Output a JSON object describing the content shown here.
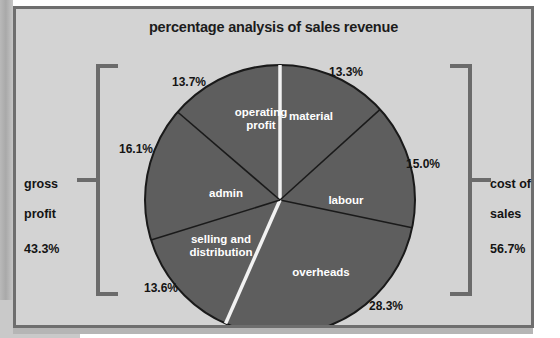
{
  "frame": {
    "background_color": "#d3d3d3",
    "border_color": "#6e6e6e"
  },
  "title": "percentage analysis of sales revenue",
  "left_bracket": {
    "name": "gross profit",
    "label_line1": "gross",
    "label_line2": "profit",
    "value": "43.3%"
  },
  "right_bracket": {
    "name": "cost of sales",
    "label_line1": "cost of",
    "label_line2": "sales",
    "value": "56.7%"
  },
  "chart_data": {
    "type": "pie",
    "title": "percentage analysis of sales revenue",
    "unit": "percent",
    "slice_color": "#5e5e5e",
    "separator_color": "#1a1a1a",
    "group_separator_color": "#f2f2f2",
    "label_color": "#ffffff",
    "categories": [
      "material",
      "labour",
      "overheads",
      "selling and distribution",
      "admin",
      "operating profit"
    ],
    "values": [
      13.3,
      15.0,
      28.3,
      13.6,
      16.1,
      13.7
    ],
    "value_labels": [
      "13.3%",
      "15.0%",
      "28.3%",
      "13.6%",
      "16.1%",
      "13.7%"
    ],
    "groups": [
      {
        "name": "cost of sales",
        "value": 56.7,
        "value_label": "56.7%",
        "members": [
          "material",
          "labour",
          "overheads"
        ]
      },
      {
        "name": "gross profit",
        "value": 43.3,
        "value_label": "43.3%",
        "members": [
          "selling and distribution",
          "admin",
          "operating profit"
        ]
      }
    ],
    "legend": "none",
    "grid": false,
    "start_angle_deg": 0,
    "direction": "clockwise"
  },
  "slices": [
    {
      "id": "material",
      "label": "material",
      "pct": "13.3%",
      "label_x": 295,
      "label_y": 108,
      "pct_x": 335,
      "pct_y": 63
    },
    {
      "id": "labour",
      "label": "labour",
      "pct": "15.0%",
      "label_x": 330,
      "label_y": 192,
      "pct_x": 412,
      "pct_y": 155
    },
    {
      "id": "overheads",
      "label": "overheads",
      "pct": "28.3%",
      "label_x": 305,
      "label_y": 264,
      "pct_x": 375,
      "pct_y": 297
    },
    {
      "id": "selling-and-distribution",
      "label": "selling and\ndistribution",
      "pct": "13.6%",
      "label_x": 205,
      "label_y": 231,
      "pct_x": 150,
      "pct_y": 279
    },
    {
      "id": "admin",
      "label": "admin",
      "pct": "16.1%",
      "label_x": 210,
      "label_y": 185,
      "pct_x": 125,
      "pct_y": 140
    },
    {
      "id": "operating-profit",
      "label": "operating\nprofit",
      "pct": "13.7%",
      "label_x": 245,
      "label_y": 104,
      "pct_x": 178,
      "pct_y": 73
    }
  ]
}
